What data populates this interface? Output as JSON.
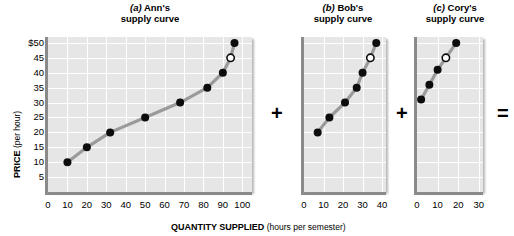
{
  "figure": {
    "y_axis_title_bold": "PRICE",
    "y_axis_title_rest": " (per hour)",
    "x_axis_title_bold": "QUANTITY SUPPLIED",
    "x_axis_title_rest": " (hours per semester)",
    "operator_plus_1": "+",
    "operator_plus_2": "+",
    "operator_equals": "="
  },
  "panels": [
    {
      "key": "ann",
      "letter": "(a)",
      "owner": "Ann's",
      "title_line2": "supply curve",
      "x_ticks": [
        "0",
        "10",
        "20",
        "30",
        "40",
        "50",
        "60",
        "70",
        "80",
        "90",
        "100"
      ],
      "y_ticks": [
        "$50",
        "45",
        "40",
        "35",
        "30",
        "25",
        "20",
        "15",
        "10",
        "5"
      ]
    },
    {
      "key": "bob",
      "letter": "(b)",
      "owner": "Bob's",
      "title_line2": "supply curve",
      "x_ticks": [
        "0",
        "10",
        "20",
        "30",
        "40"
      ],
      "y_ticks": []
    },
    {
      "key": "cory",
      "letter": "(c)",
      "owner": "Cory's",
      "title_line2": "supply curve",
      "x_ticks": [
        "0",
        "10",
        "20",
        "30"
      ],
      "y_ticks": []
    }
  ],
  "chart_data": [
    {
      "type": "line",
      "title": "(a) Ann's supply curve",
      "xlabel": "QUANTITY SUPPLIED (hours per semester)",
      "ylabel": "PRICE (per hour)",
      "xlim": [
        0,
        105
      ],
      "ylim": [
        0,
        52
      ],
      "grid": true,
      "legend": "none",
      "series": [
        {
          "name": "Ann's supply curve",
          "points": [
            {
              "x": 10,
              "y": 10,
              "marker": "filled"
            },
            {
              "x": 20,
              "y": 15,
              "marker": "filled"
            },
            {
              "x": 32,
              "y": 20,
              "marker": "filled"
            },
            {
              "x": 50,
              "y": 25,
              "marker": "filled"
            },
            {
              "x": 68,
              "y": 30,
              "marker": "filled"
            },
            {
              "x": 82,
              "y": 35,
              "marker": "filled"
            },
            {
              "x": 90,
              "y": 40,
              "marker": "filled"
            },
            {
              "x": 94,
              "y": 45,
              "marker": "open"
            },
            {
              "x": 96,
              "y": 50,
              "marker": "filled"
            }
          ]
        }
      ]
    },
    {
      "type": "line",
      "title": "(b) Bob's supply curve",
      "xlabel": "QUANTITY SUPPLIED (hours per semester)",
      "ylabel": "PRICE (per hour)",
      "xlim": [
        0,
        42
      ],
      "ylim": [
        0,
        52
      ],
      "grid": true,
      "legend": "none",
      "series": [
        {
          "name": "Bob's supply curve",
          "points": [
            {
              "x": 7,
              "y": 20,
              "marker": "filled"
            },
            {
              "x": 13,
              "y": 25,
              "marker": "filled"
            },
            {
              "x": 21,
              "y": 30,
              "marker": "filled"
            },
            {
              "x": 27,
              "y": 35,
              "marker": "filled"
            },
            {
              "x": 30,
              "y": 40,
              "marker": "filled"
            },
            {
              "x": 34,
              "y": 45,
              "marker": "open"
            },
            {
              "x": 37,
              "y": 50,
              "marker": "filled"
            }
          ]
        }
      ]
    },
    {
      "type": "line",
      "title": "(c) Cory's supply curve",
      "xlabel": "QUANTITY SUPPLIED (hours per semester)",
      "ylabel": "PRICE (per hour)",
      "xlim": [
        0,
        32
      ],
      "ylim": [
        0,
        52
      ],
      "grid": true,
      "legend": "none",
      "series": [
        {
          "name": "Cory's supply curve",
          "points": [
            {
              "x": 2,
              "y": 31,
              "marker": "filled"
            },
            {
              "x": 6,
              "y": 36,
              "marker": "filled"
            },
            {
              "x": 10,
              "y": 41,
              "marker": "filled"
            },
            {
              "x": 14,
              "y": 45,
              "marker": "open"
            },
            {
              "x": 19,
              "y": 50,
              "marker": "filled"
            }
          ]
        }
      ]
    }
  ]
}
